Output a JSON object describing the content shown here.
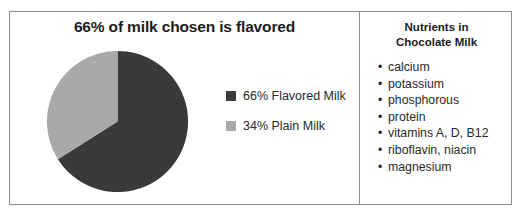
{
  "chart_data": {
    "type": "pie",
    "title": "66% of milk chosen is flavored",
    "categories": [
      "66% Flavored Milk",
      "34% Plain Milk"
    ],
    "values": [
      66,
      34
    ],
    "units": "percent",
    "colors": [
      "#3a3a3a",
      "#a9a9a9"
    ],
    "legend_position": "right",
    "start_angle_deg": 0,
    "direction": "clockwise",
    "grid": false,
    "xlabel": "",
    "ylabel": "",
    "slices": [
      {
        "label": "66% Flavored Milk",
        "value": 66,
        "color": "#3a3a3a"
      },
      {
        "label": "34% Plain Milk",
        "value": 34,
        "color": "#a9a9a9"
      }
    ]
  },
  "chart_panel": {
    "title": "66% of milk chosen is flavored",
    "legend": [
      {
        "label": "66% Flavored Milk",
        "color": "#3a3a3a"
      },
      {
        "label": "34% Plain Milk",
        "color": "#a9a9a9"
      }
    ]
  },
  "nutrients_panel": {
    "heading_line1": "Nutrients in",
    "heading_line2": "Chocolate Milk",
    "bullet_glyph": "•",
    "items": [
      "calcium",
      "potassium",
      "phosphorous",
      "protein",
      "vitamins A, D, B12",
      "riboflavin, niacin",
      "magnesium"
    ]
  },
  "style": {
    "border_color": "#8e8e8e",
    "background": "#ffffff",
    "text_color": "#242424",
    "dark_slice": "#3a3a3a",
    "light_slice": "#a9a9a9"
  }
}
